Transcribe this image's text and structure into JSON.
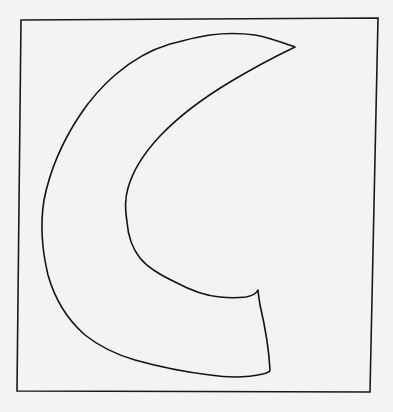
{
  "figure": {
    "background_color": "#f3f3f2",
    "stroke_color": "#141414",
    "frame": {
      "points": [
        [
          21,
          20
        ],
        [
          378,
          18
        ],
        [
          370,
          392
        ],
        [
          17,
          391
        ]
      ]
    },
    "shape": {
      "label": "crescent",
      "outer_top_tip": [
        295,
        47
      ],
      "outer_leftmost": [
        42,
        215
      ],
      "inner_leftmost": [
        125,
        200
      ],
      "inner_bottom_end": [
        258,
        290
      ],
      "outer_bottom_end": [
        270,
        370
      ]
    }
  }
}
